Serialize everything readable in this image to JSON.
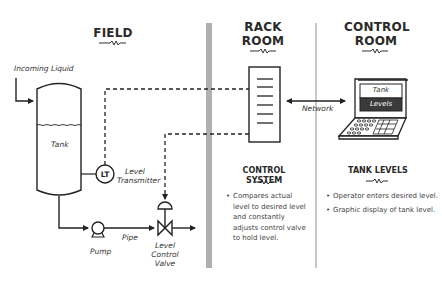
{
  "sections": {
    "field": {
      "title": "FIELD"
    },
    "rack_room": {
      "title_line1": "RACK",
      "title_line2": "ROOM"
    },
    "control_room": {
      "title_line1": "CONTROL",
      "title_line2": "ROOM"
    }
  },
  "field_labels": {
    "incoming_liquid": "Incoming Liquid",
    "tank": "Tank",
    "lt": "LT",
    "level_transmitter_line1": "Level",
    "level_transmitter_line2": "Transmitter",
    "pump": "Pump",
    "pipe": "Pipe",
    "valve_line1": "Level",
    "valve_line2": "Control",
    "valve_line3": "Valve"
  },
  "network_label": "Network",
  "laptop_screen": {
    "line1": "Tank",
    "line2": "Levels"
  },
  "control_system": {
    "title": "CONTROL SYSTEM",
    "bullets": [
      "Compares actual level to desired level and constantly adjusts control valve to hold level."
    ]
  },
  "tank_levels": {
    "title": "TANK LEVELS",
    "bullets": [
      "Operator enters desired level.",
      "Graphic display of tank level."
    ]
  },
  "colors": {
    "divider_thick": "#b0b0b0",
    "divider_thin": "#c8c8c8",
    "line": "#222222",
    "screen_dark": "#3a3a3a"
  }
}
